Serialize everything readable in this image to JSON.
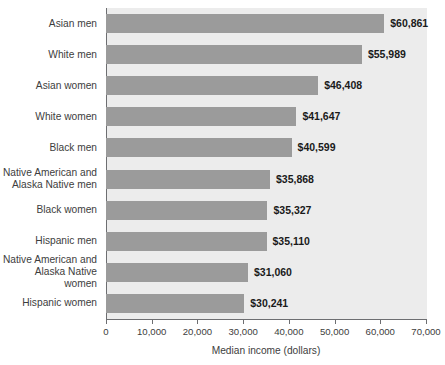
{
  "chart_data": {
    "type": "bar",
    "orientation": "horizontal",
    "title": "",
    "xlabel": "Median income (dollars)",
    "ylabel": "",
    "xlim": [
      0,
      70000
    ],
    "xticks": [
      0,
      10000,
      20000,
      30000,
      40000,
      50000,
      60000,
      70000
    ],
    "xtick_labels": [
      "0",
      "10,000",
      "20,000",
      "30,000",
      "40,000",
      "50,000",
      "60,000",
      "70,000"
    ],
    "grid": false,
    "legend": false,
    "categories": [
      "Asian men",
      "White men",
      "Asian women",
      "White women",
      "Black men",
      "Native American and\nAlaska Native men",
      "Black women",
      "Hispanic men",
      "Native American and\nAlaska Native women",
      "Hispanic women"
    ],
    "values": [
      60861,
      55989,
      46408,
      41647,
      40599,
      35868,
      35327,
      35110,
      31060,
      30241
    ],
    "value_labels": [
      "$60,861",
      "$55,989",
      "$46,408",
      "$41,647",
      "$40,599",
      "$35,868",
      "$35,327",
      "$35,110",
      "$31,060",
      "$30,241"
    ]
  },
  "colors": {
    "bar": "#9b9b9b",
    "plot_background": "#ececec",
    "page_background": "#ffffff",
    "axis": "#6d6e71",
    "label_text": "#3d3d3d",
    "value_text": "#1a1a1a"
  }
}
